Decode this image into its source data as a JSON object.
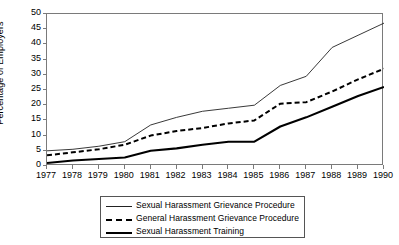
{
  "chart_data": {
    "type": "line",
    "title": "",
    "subtitle": "",
    "xlabel": "",
    "ylabel": "Percentage of Employers",
    "categories": [
      "1977",
      "1978",
      "1979",
      "1980",
      "1981",
      "1982",
      "1983",
      "1984",
      "1985",
      "1986",
      "1987",
      "1988",
      "1989",
      "1990"
    ],
    "x": [
      1977,
      1978,
      1979,
      1980,
      1981,
      1982,
      1983,
      1984,
      1985,
      1986,
      1987,
      1988,
      1989,
      1990
    ],
    "xlim": [
      1977,
      1990
    ],
    "ylim": [
      0,
      50
    ],
    "yticks": [
      0,
      5,
      10,
      15,
      20,
      25,
      30,
      35,
      40,
      45,
      50
    ],
    "ytick_labels": [
      "0",
      "5",
      "10",
      "15",
      "20",
      "25",
      "30",
      "35",
      "40",
      "45",
      "50"
    ],
    "grid": false,
    "legend_position": "bottom",
    "series": [
      {
        "name": "Sexual Harassment Grievance Procedure",
        "style": "thin-solid",
        "color": "#222222",
        "values": [
          5,
          5.5,
          6.5,
          8,
          13.5,
          16,
          18,
          19,
          20,
          26.5,
          29.5,
          39,
          43,
          47
        ]
      },
      {
        "name": "General Harassment Grievance Procedure",
        "style": "dashed",
        "color": "#000000",
        "values": [
          3.5,
          4.5,
          5.5,
          7,
          10,
          11.5,
          12.5,
          14,
          15,
          20.5,
          21,
          24.5,
          28.5,
          32
        ]
      },
      {
        "name": "Sexual Harassment Training",
        "style": "thick-solid",
        "color": "#000000",
        "values": [
          1,
          1.8,
          2.3,
          2.8,
          5,
          5.8,
          7,
          8,
          8,
          13,
          16,
          19.5,
          23,
          26
        ]
      }
    ]
  },
  "axes": {
    "y_title": "Percentage of Employers"
  },
  "legend": {
    "entries": [
      {
        "label": "Sexual Harassment Grievance Procedure"
      },
      {
        "label": "General Harassment Grievance Procedure"
      },
      {
        "label": "Sexual Harassment Training"
      }
    ]
  }
}
